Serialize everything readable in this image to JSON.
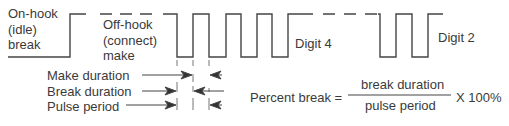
{
  "diagram": {
    "type": "pulse-dialing-waveform",
    "labels": {
      "on_hook": [
        "On-hook",
        "(idle)",
        "break"
      ],
      "off_hook": [
        "Off-hook",
        "(connect)",
        "make"
      ],
      "digit_4": "Digit 4",
      "digit_2": "Digit 2",
      "make_duration": "Make duration",
      "break_duration": "Break duration",
      "pulse_period": "Pulse period"
    },
    "formula": {
      "lhs": "Percent break =",
      "numerator": "break duration",
      "denominator": "pulse period",
      "multiplier": "X 100%"
    },
    "waveform": {
      "high_y": 14,
      "low_y": 57,
      "digit_4_pulses": 4,
      "digit_2_pulses": 2,
      "line_color": "#444444"
    }
  }
}
